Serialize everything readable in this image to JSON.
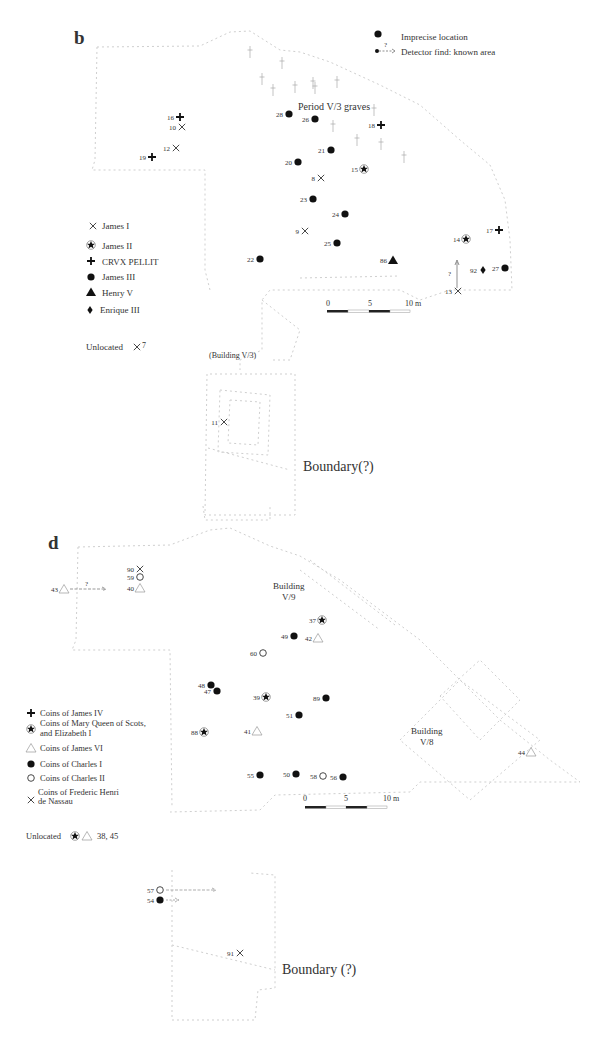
{
  "panels": [
    {
      "id": "b",
      "label": "b",
      "header_legend": [
        {
          "symbol": "dot",
          "text": "Imprecise location"
        },
        {
          "symbol": "dot-arrow",
          "marker": "?",
          "text": "Detector find: known area"
        }
      ],
      "annotations": {
        "graves": "Period V/3 graves",
        "building": "(Building V/3)",
        "boundary": "Boundary(?)"
      },
      "legend": [
        {
          "symbol": "cross-x",
          "text": "James I"
        },
        {
          "symbol": "star-circle",
          "text": "James II"
        },
        {
          "symbol": "plus",
          "text": "CRVX PELLIT"
        },
        {
          "symbol": "dot",
          "text": "James III"
        },
        {
          "symbol": "triangle-filled",
          "text": "Henry V"
        },
        {
          "symbol": "diamond",
          "text": "Enrique III"
        }
      ],
      "unlocated": {
        "label": "Unlocated",
        "symbol": "cross-x",
        "values": "7"
      },
      "scale": {
        "ticks": [
          "0",
          "5",
          "10 m"
        ]
      },
      "finds": [
        {
          "id": "16",
          "symbol": "plus",
          "x": 180,
          "y": 117
        },
        {
          "id": "10",
          "symbol": "cross-x",
          "x": 182,
          "y": 127
        },
        {
          "id": "12",
          "symbol": "cross-x",
          "x": 176,
          "y": 148
        },
        {
          "id": "19",
          "symbol": "plus",
          "x": 152,
          "y": 157
        },
        {
          "id": "28",
          "symbol": "dot",
          "x": 289,
          "y": 114
        },
        {
          "id": "26",
          "symbol": "dot",
          "x": 315,
          "y": 119
        },
        {
          "id": "18",
          "symbol": "plus",
          "x": 381,
          "y": 125
        },
        {
          "id": "21",
          "symbol": "dot",
          "x": 331,
          "y": 150
        },
        {
          "id": "20",
          "symbol": "dot",
          "x": 298,
          "y": 162
        },
        {
          "id": "15",
          "symbol": "star-circle",
          "x": 364,
          "y": 169
        },
        {
          "id": "8",
          "symbol": "cross-x",
          "x": 321,
          "y": 178
        },
        {
          "id": "23",
          "symbol": "dot",
          "x": 313,
          "y": 199
        },
        {
          "id": "24",
          "symbol": "dot",
          "x": 345,
          "y": 214
        },
        {
          "id": "9",
          "symbol": "cross-x",
          "x": 305,
          "y": 231
        },
        {
          "id": "25",
          "symbol": "dot",
          "x": 337,
          "y": 243
        },
        {
          "id": "22",
          "symbol": "dot",
          "x": 260,
          "y": 259
        },
        {
          "id": "86",
          "symbol": "triangle-filled",
          "x": 393,
          "y": 260
        },
        {
          "id": "14",
          "symbol": "star-circle",
          "x": 466,
          "y": 239
        },
        {
          "id": "17",
          "symbol": "plus",
          "x": 499,
          "y": 230
        },
        {
          "id": "27",
          "symbol": "dot",
          "x": 505,
          "y": 268
        },
        {
          "id": "92",
          "symbol": "diamond",
          "x": 483,
          "y": 270
        },
        {
          "id": "13",
          "symbol": "cross-x",
          "x": 458,
          "y": 291
        },
        {
          "id": "11",
          "symbol": "cross-x",
          "x": 224,
          "y": 422
        }
      ]
    },
    {
      "id": "d",
      "label": "d",
      "annotations": {
        "building_v9_line1": "Building",
        "building_v9_line2": "V/9",
        "building_v8_line1": "Building",
        "building_v8_line2": "V/8",
        "boundary": "Boundary (?)"
      },
      "legend": [
        {
          "symbol": "plus",
          "text": "Coins of James IV"
        },
        {
          "symbol": "star-circle",
          "text": "Coins of Mary Queen of Scots,",
          "text2": "and Elizabeth I"
        },
        {
          "symbol": "triangle-open",
          "text": "Coins of James VI"
        },
        {
          "symbol": "dot",
          "text": "Coins of Charles I"
        },
        {
          "symbol": "circle-open",
          "text": "Coins of Charles II"
        },
        {
          "symbol": "cross-x",
          "text": "Coins of Frederic Henri",
          "text2": "de Nassau"
        }
      ],
      "unlocated": {
        "label": "Unlocated",
        "values": "38, 45"
      },
      "scale": {
        "ticks": [
          "0",
          "5",
          "10 m"
        ]
      },
      "finds": [
        {
          "id": "90",
          "symbol": "cross-x",
          "x": 140,
          "y": 569
        },
        {
          "id": "59",
          "symbol": "circle-open",
          "x": 140,
          "y": 577
        },
        {
          "id": "40",
          "symbol": "triangle-open",
          "x": 140,
          "y": 588
        },
        {
          "id": "43",
          "symbol": "triangle-open",
          "x": 64,
          "y": 589
        },
        {
          "id": "37",
          "symbol": "star-circle",
          "x": 322,
          "y": 620
        },
        {
          "id": "49",
          "symbol": "dot",
          "x": 294,
          "y": 636
        },
        {
          "id": "42",
          "symbol": "triangle-open",
          "x": 318,
          "y": 638
        },
        {
          "id": "60",
          "symbol": "circle-open",
          "x": 263,
          "y": 653
        },
        {
          "id": "48",
          "symbol": "dot",
          "x": 211,
          "y": 685
        },
        {
          "id": "47",
          "symbol": "dot",
          "x": 217,
          "y": 691
        },
        {
          "id": "39",
          "symbol": "star-circle",
          "x": 266,
          "y": 697
        },
        {
          "id": "89",
          "symbol": "dot",
          "x": 326,
          "y": 698
        },
        {
          "id": "51",
          "symbol": "dot",
          "x": 299,
          "y": 715
        },
        {
          "id": "88",
          "symbol": "star-circle",
          "x": 204,
          "y": 732
        },
        {
          "id": "41",
          "symbol": "triangle-open",
          "x": 257,
          "y": 731
        },
        {
          "id": "55",
          "symbol": "dot",
          "x": 260,
          "y": 775
        },
        {
          "id": "50",
          "symbol": "dot",
          "x": 296,
          "y": 774
        },
        {
          "id": "58",
          "symbol": "circle-open",
          "x": 323,
          "y": 776
        },
        {
          "id": "56",
          "symbol": "dot",
          "x": 343,
          "y": 777
        },
        {
          "id": "44",
          "symbol": "triangle-open",
          "x": 531,
          "y": 752
        },
        {
          "id": "57",
          "symbol": "circle-open",
          "x": 160,
          "y": 890
        },
        {
          "id": "54",
          "symbol": "dot",
          "x": 160,
          "y": 900
        },
        {
          "id": "91",
          "symbol": "cross-x",
          "x": 240,
          "y": 953
        }
      ]
    }
  ]
}
